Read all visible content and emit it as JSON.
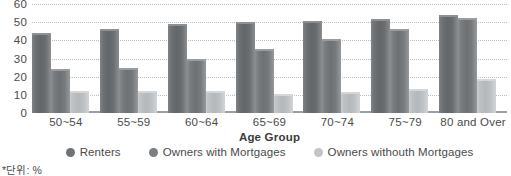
{
  "chart_data": {
    "type": "bar",
    "title": "",
    "xlabel": "Age Group",
    "ylabel": "",
    "ylim": [
      0,
      60
    ],
    "yticks": [
      60,
      50,
      40,
      30,
      20,
      10,
      0
    ],
    "grid": true,
    "legend_position": "bottom",
    "categories": [
      "50~54",
      "55~59",
      "60~64",
      "65~69",
      "70~74",
      "75~79",
      "80 and Over"
    ],
    "series": [
      {
        "name": "Renters",
        "color": "#6f7376",
        "values": [
          44,
          46,
          49,
          50,
          50.5,
          52,
          54
        ]
      },
      {
        "name": "Owners with Mortgages",
        "color": "#7b7f82",
        "values": [
          24,
          25,
          30,
          35.5,
          41,
          46.5,
          52.5
        ]
      },
      {
        "name": "Owners withouth Mortgages",
        "color": "#c2c5c7",
        "values": [
          12.2,
          12.2,
          12.2,
          10.5,
          11.5,
          13,
          18.5
        ]
      }
    ],
    "footnote": "*단위: %"
  }
}
